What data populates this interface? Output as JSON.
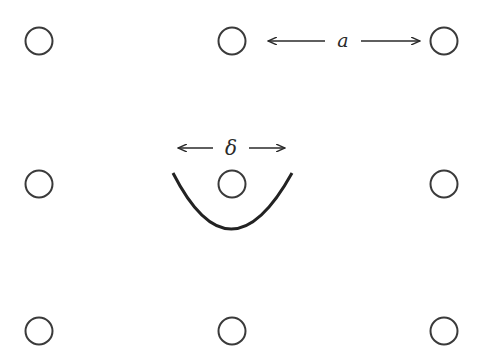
{
  "diagram": {
    "lattice": {
      "rows": 3,
      "cols": 3,
      "x": [
        39,
        232,
        444
      ],
      "y": [
        41,
        184,
        331
      ],
      "radius": 14
    },
    "labels": {
      "spacing": "a",
      "well_width": "δ"
    },
    "colors": {
      "stroke": "#3a3a3a",
      "background": "#ffffff"
    }
  }
}
